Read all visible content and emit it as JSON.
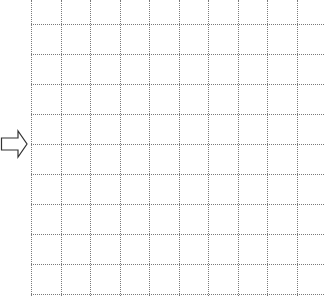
{
  "diagram": {
    "type": "dotted-grid-with-arrow",
    "background": "#ffffff",
    "grid": {
      "line_color": "#7a7a7a",
      "line_style": "dotted",
      "columns": 10,
      "rows": 9,
      "vertical_lines_x": [
        31,
        60.5,
        90,
        119.5,
        149,
        178.5,
        208,
        237.5,
        267,
        296.5
      ],
      "horizontal_lines_y": [
        24,
        54,
        84,
        114,
        144,
        174,
        204,
        234,
        264,
        294
      ],
      "left_edge_x": 31,
      "top_extent_y": 0,
      "bottom_extent_y": 296,
      "right_extent_x": 324
    },
    "arrow": {
      "icon": "hollow-right-arrow-icon",
      "direction": "right",
      "stroke_color": "#333333",
      "fill": "#ffffff"
    }
  }
}
